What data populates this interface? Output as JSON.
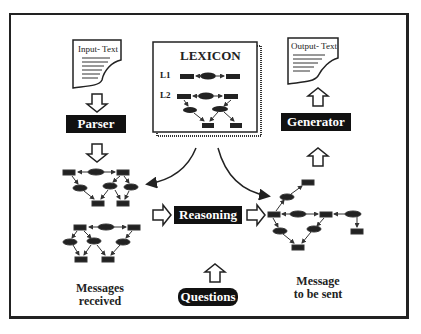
{
  "diagram": {
    "input_doc": {
      "title": "Input- Text"
    },
    "output_doc": {
      "title": "Output- Text"
    },
    "lexicon": {
      "title": "LEXICON",
      "rows": [
        "L1",
        "L2"
      ]
    },
    "nodes": {
      "parser": "Parser",
      "generator": "Generator",
      "reasoning": "Reasoning",
      "questions": "Questions"
    },
    "captions": {
      "received": "Messages received",
      "received_line1": "Messages",
      "received_line2": "received",
      "sent_line1": "Message",
      "sent_line2": "to be sent"
    },
    "colors": {
      "box_fill": "#111111",
      "box_text": "#ffffff",
      "line": "#222222"
    }
  }
}
